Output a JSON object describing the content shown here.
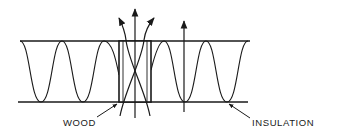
{
  "diagram": {
    "labels": {
      "wood": "WOOD",
      "insulation": "INSULATION"
    },
    "colors": {
      "line": "#1a1a1a",
      "background": "#ffffff"
    },
    "elements": {
      "wall_faces": 2,
      "wood_stud": 1,
      "insulation_wave": "sinusoidal batt pattern",
      "heat_flow_arrows_through_wood": 3,
      "heat_flow_arrows_through_insulation": 1
    }
  }
}
